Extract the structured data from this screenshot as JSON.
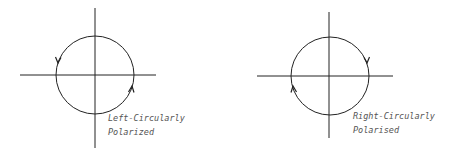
{
  "diagrams": [
    {
      "id": "left",
      "title_lines": [
        "Left-Circularly",
        "Polarized"
      ],
      "rotation": "counterclockwise",
      "axes": {
        "vertical": {
          "x": 95,
          "y1": 8,
          "y2": 148
        },
        "horizontal": {
          "y": 75,
          "x1": 20,
          "x2": 156
        }
      },
      "circle": {
        "cx": 95,
        "cy": 75,
        "r": 39
      },
      "arrows": [
        {
          "position": "upper-left",
          "x": 58,
          "y": 60,
          "direction": "down"
        },
        {
          "position": "lower-right",
          "x": 132,
          "y": 89,
          "direction": "up"
        }
      ],
      "label_position": {
        "x": 108,
        "y": 111
      }
    },
    {
      "id": "right",
      "title_lines": [
        "Right-Circularly",
        "Polarised"
      ],
      "rotation": "clockwise",
      "axes": {
        "vertical": {
          "x": 329,
          "y1": 12,
          "y2": 138
        },
        "horizontal": {
          "y": 76,
          "x1": 257,
          "x2": 393
        }
      },
      "circle": {
        "cx": 330,
        "cy": 76,
        "r": 39
      },
      "arrows": [
        {
          "position": "upper-right",
          "x": 367,
          "y": 60,
          "direction": "down"
        },
        {
          "position": "lower-left",
          "x": 293,
          "y": 87,
          "direction": "up"
        }
      ],
      "label_position": {
        "x": 353,
        "y": 109
      }
    }
  ],
  "colors": {
    "stroke": "#222222",
    "label": "#555555",
    "background": "#ffffff"
  }
}
